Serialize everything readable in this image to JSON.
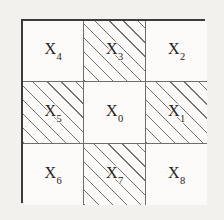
{
  "figure": {
    "type": "moore-neighborhood-diagram",
    "background_color": "#f2f1ee",
    "grid": {
      "rows": 3,
      "columns": 3,
      "outer_border_color": "#3b3b3b",
      "inner_line_color": "#6e6e6e",
      "cell_fill_color": "#fbfaf8",
      "hatch_color": "#5a5a5a",
      "hatch_angle_degrees": 45,
      "hatch_spacing_px": 10,
      "cells": [
        {
          "id": "cell-x4",
          "symbol": "X",
          "subscript": "4",
          "row": 1,
          "column": 1,
          "hatched": false
        },
        {
          "id": "cell-x3",
          "symbol": "X",
          "subscript": "3",
          "row": 1,
          "column": 2,
          "hatched": true
        },
        {
          "id": "cell-x2",
          "symbol": "X",
          "subscript": "2",
          "row": 1,
          "column": 3,
          "hatched": false
        },
        {
          "id": "cell-x5",
          "symbol": "X",
          "subscript": "5",
          "row": 2,
          "column": 1,
          "hatched": true
        },
        {
          "id": "cell-x0",
          "symbol": "X",
          "subscript": "0",
          "row": 2,
          "column": 2,
          "hatched": false
        },
        {
          "id": "cell-x1",
          "symbol": "X",
          "subscript": "1",
          "row": 2,
          "column": 3,
          "hatched": true
        },
        {
          "id": "cell-x6",
          "symbol": "X",
          "subscript": "6",
          "row": 3,
          "column": 1,
          "hatched": false
        },
        {
          "id": "cell-x7",
          "symbol": "X",
          "subscript": "7",
          "row": 3,
          "column": 2,
          "hatched": true
        },
        {
          "id": "cell-x8",
          "symbol": "X",
          "subscript": "8",
          "row": 3,
          "column": 3,
          "hatched": false
        }
      ]
    }
  }
}
